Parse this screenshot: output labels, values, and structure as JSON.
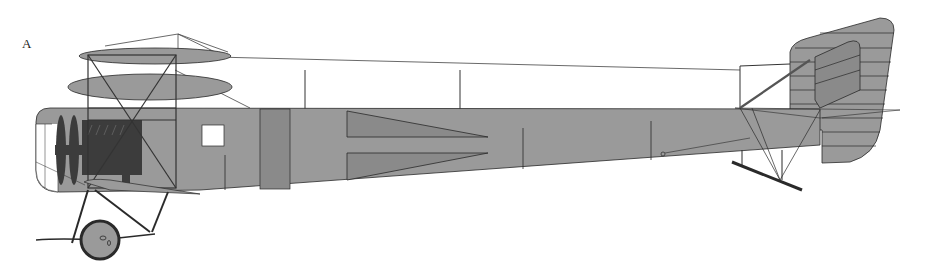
{
  "figure": {
    "label": "A",
    "colors": {
      "fabric": "#9a9a9a",
      "fabric_dark": "#8a8a8a",
      "outline": "#2a2a2a",
      "engine": "#3c3c3c",
      "background": "#ffffff"
    }
  }
}
